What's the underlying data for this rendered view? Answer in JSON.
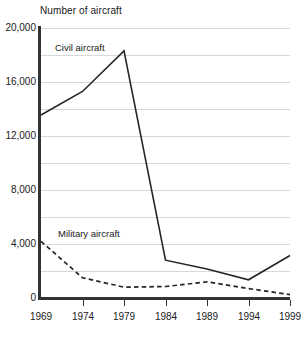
{
  "chart_data": {
    "type": "line",
    "title": "Number of aircraft",
    "xlabel": "",
    "ylabel": "",
    "x": [
      1969,
      1974,
      1979,
      1984,
      1989,
      1994,
      1999
    ],
    "categories": [
      "1969",
      "1974",
      "1979",
      "1984",
      "1989",
      "1994",
      "1999"
    ],
    "series": [
      {
        "name": "Civil aircraft",
        "values": [
          13550,
          15300,
          18300,
          2800,
          2150,
          1350,
          3150
        ],
        "style": "solid",
        "color": "#262626"
      },
      {
        "name": "Military aircraft",
        "values": [
          4200,
          1500,
          800,
          850,
          1200,
          700,
          250
        ],
        "style": "dashed",
        "color": "#262626"
      }
    ],
    "ylim": [
      0,
      20000
    ],
    "xlim": [
      1969,
      1999
    ],
    "y_ticks": [
      0,
      4000,
      8000,
      12000,
      16000,
      20000
    ],
    "y_tick_labels": [
      "0",
      "4,000",
      "8,000",
      "12,000",
      "16,000",
      "20,000"
    ],
    "gridline_interval": 2000,
    "grid": true,
    "grid_axis": "y",
    "legend": "inline-annotations",
    "annotations": [
      {
        "text": "Civil aircraft",
        "series": "Civil aircraft"
      },
      {
        "text": "Military aircraft",
        "series": "Military aircraft"
      }
    ],
    "background": "#ffffff",
    "axis_color": "#333333",
    "grid_color": "#d8d8d8"
  },
  "axis": {
    "y_labels": [
      "20,000",
      "16,000",
      "12,000",
      "8,000",
      "4,000",
      "0"
    ],
    "x_labels": [
      "1969",
      "1974",
      "1979",
      "1984",
      "1989",
      "1994",
      "1999"
    ]
  },
  "annotations": {
    "civil": "Civil aircraft",
    "military": "Military aircraft"
  },
  "title": "Number of aircraft"
}
